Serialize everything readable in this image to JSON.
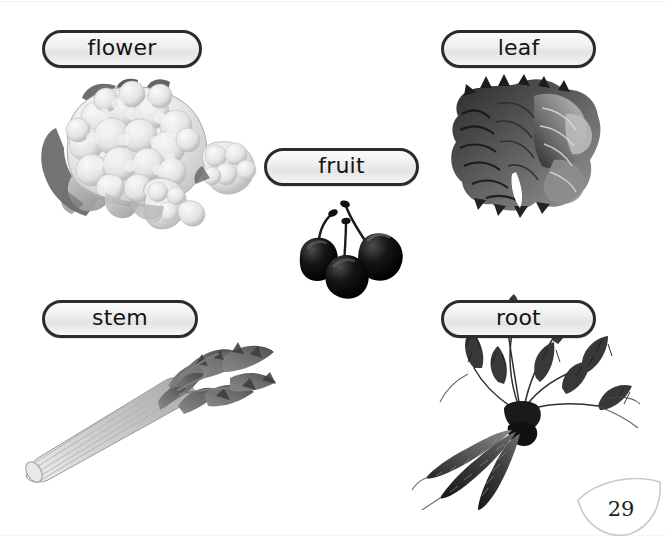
{
  "page": {
    "number": "29",
    "background_color": "#ffffff",
    "page_number_shape": "leaf-corner-outline"
  },
  "labels": {
    "flower": "flower",
    "leaf": "leaf",
    "fruit": "fruit",
    "stem": "stem",
    "root": "root"
  },
  "style": {
    "pill_border_color": "#2b2b2b",
    "pill_fill_top": "#fbfbfb",
    "pill_fill_bottom": "#e4e4e4",
    "text_color": "#141414",
    "page_number_outline_color": "#c9c9cc"
  },
  "illustrations": [
    {
      "name": "cauliflower",
      "depicts": "flower",
      "tone": "light-gray"
    },
    {
      "name": "lettuce-leaf",
      "depicts": "leaf",
      "tone": "dark-gray"
    },
    {
      "name": "cherries",
      "depicts": "fruit",
      "tone": "black",
      "count": 3
    },
    {
      "name": "celery-stalk",
      "depicts": "stem",
      "tone": "mid-gray"
    },
    {
      "name": "carrots",
      "depicts": "root",
      "tone": "dark-gray",
      "count": 3
    }
  ]
}
